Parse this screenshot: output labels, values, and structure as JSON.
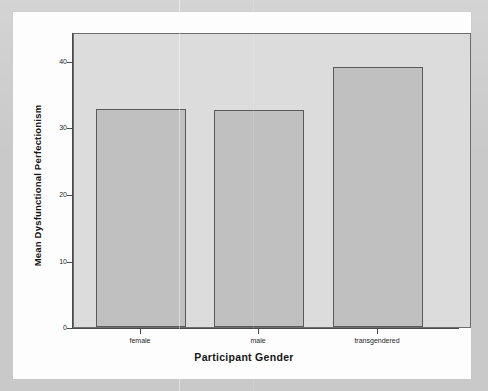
{
  "chart_data": {
    "type": "bar",
    "title": "",
    "xlabel": "Participant Gender",
    "ylabel": "Mean Dysfunctional Perfectionism",
    "categories": [
      "female",
      "male",
      "transgendered"
    ],
    "values": [
      32.7,
      32.6,
      39.0
    ],
    "ylim": [
      0,
      44
    ],
    "yticks": [
      0,
      10,
      20,
      30,
      40
    ],
    "ytick_labels": [
      "0",
      "10",
      "20",
      "30",
      "40"
    ],
    "grid": false,
    "legend": null,
    "series": [
      {
        "name": "Mean Dysfunctional Perfectionism",
        "values": [
          32.7,
          32.6,
          39.0
        ]
      }
    ],
    "bar_fill_color": "#c0c0c0",
    "bar_edge_color": "#5a5a5a",
    "plot_background_color": "#dcdcdc",
    "figure_background_color": "#fdfdfd",
    "page_background_color": "#c9c9c9"
  },
  "axes": {
    "y_title": "Mean Dysfunctional Perfectionism",
    "x_title": "Participant Gender",
    "y_ticks": [
      {
        "label": "40",
        "value": 40
      },
      {
        "label": "30",
        "value": 30
      },
      {
        "label": "20",
        "value": 20
      },
      {
        "label": "10",
        "value": 10
      },
      {
        "label": "0",
        "value": 0
      }
    ],
    "x_ticks": [
      {
        "label": "female"
      },
      {
        "label": "male"
      },
      {
        "label": "transgendered"
      }
    ]
  }
}
